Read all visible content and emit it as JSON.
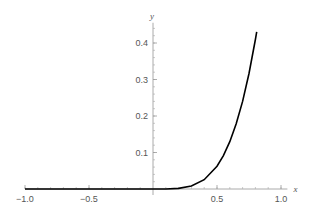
{
  "chart_data": {
    "type": "line",
    "title": "",
    "xlabel": "x",
    "ylabel": "y",
    "xlim": [
      -1.0,
      1.05
    ],
    "ylim": [
      0,
      0.45
    ],
    "grid": false,
    "x_ticks": [
      {
        "value": -1.0,
        "label": "−1.0"
      },
      {
        "value": -0.5,
        "label": "−0.5"
      },
      {
        "value": 0.5,
        "label": "0.5"
      },
      {
        "value": 1.0,
        "label": "1.0"
      }
    ],
    "y_ticks": [
      {
        "value": 0.1,
        "label": "0.1"
      },
      {
        "value": 0.2,
        "label": "0.2"
      },
      {
        "value": 0.3,
        "label": "0.3"
      },
      {
        "value": 0.4,
        "label": "0.4"
      }
    ],
    "series": [
      {
        "name": "f(x)",
        "color": "#000000",
        "x": [
          -1.0,
          -0.8,
          -0.6,
          -0.4,
          -0.2,
          0.0,
          0.1,
          0.2,
          0.3,
          0.4,
          0.5,
          0.55,
          0.6,
          0.65,
          0.7,
          0.75,
          0.8,
          0.81
        ],
        "y": [
          0,
          0,
          0,
          0,
          0,
          0,
          0.0001,
          0.0016,
          0.0081,
          0.0256,
          0.0625,
          0.0915,
          0.1296,
          0.1785,
          0.2401,
          0.3164,
          0.4096,
          0.4305
        ]
      }
    ]
  }
}
